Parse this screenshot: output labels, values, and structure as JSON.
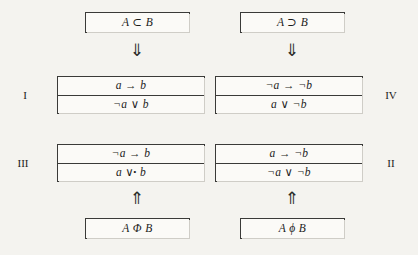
{
  "diagram": {
    "background_color": "#f4f3ef",
    "border_color": "#3a3a38",
    "top_boxes": [
      {
        "id": "A-subset-B",
        "text": "A ⊂ B"
      },
      {
        "id": "A-superset-B",
        "text": "A ⊃ B"
      }
    ],
    "arrows": {
      "down": "⇓",
      "up": "⇑"
    },
    "quadrants": [
      {
        "id": "quadrant-I",
        "numeral": "I",
        "position": "upper-left",
        "lines": [
          {
            "text": "a → b"
          },
          {
            "text": "¬a ∨ b"
          }
        ]
      },
      {
        "id": "quadrant-IV",
        "numeral": "IV",
        "position": "upper-right",
        "lines": [
          {
            "text": "¬a → ¬b"
          },
          {
            "text": "a ∨ ¬b"
          }
        ]
      },
      {
        "id": "quadrant-III",
        "numeral": "III",
        "position": "lower-left",
        "lines": [
          {
            "text": "¬a → b"
          },
          {
            "prefix": "a ∨",
            "dot": "•",
            "suffix": "b"
          }
        ]
      },
      {
        "id": "quadrant-II",
        "numeral": "II",
        "position": "lower-right",
        "lines": [
          {
            "text": "a → ¬b"
          },
          {
            "text": "¬a ∨ ¬b"
          }
        ]
      }
    ],
    "bottom_boxes": [
      {
        "id": "A-Phi-B",
        "text": "A Φ B"
      },
      {
        "id": "A-phi-B",
        "text": "A ϕ B"
      }
    ]
  }
}
